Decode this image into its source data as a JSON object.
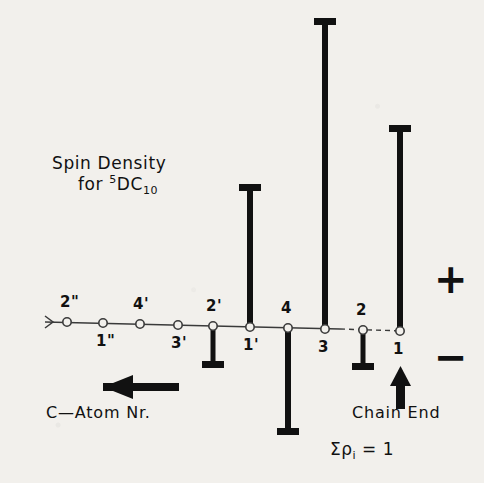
{
  "title": {
    "line1": "Spin Density",
    "line2_pre": "for ",
    "line2_sup": "5",
    "line2_mid": "DC",
    "line2_sub": "10"
  },
  "axis_caption": "C—Atom Nr.",
  "chain_end_label": "Chain End",
  "sum_rule": {
    "sigma": "Σρ",
    "sub": "i",
    "equals": "= 1",
    "full": "Σρi = 1"
  },
  "signs": {
    "positive": "+",
    "negative": "−"
  },
  "colors": {
    "ink": "#111111",
    "paper": "#f2f0ec",
    "axis": "#3a3a3a"
  },
  "chart_data": {
    "type": "bar",
    "title": "Spin Density for 5DC10",
    "xlabel": "C—Atom Nr.",
    "ylabel": "Spin density ρi",
    "grid": false,
    "legend": null,
    "orientation": "stem-plot, vertical bars with T-caps on a near-horizontal baseline",
    "note": "Baseline is the carbon chain axis; open circles mark each carbon atom. Positive bars point up (+), negative bars point down (−). Sum of all ρi equals 1.",
    "categories": [
      "2\"",
      "1\"",
      "4'",
      "3'",
      "2'",
      "1'",
      "4",
      "3",
      "2",
      "1"
    ],
    "label_side": [
      "above",
      "below",
      "above",
      "below",
      "above",
      "below",
      "above",
      "below",
      "above",
      "below"
    ],
    "values": [
      0.0,
      0.0,
      0.0,
      0.0,
      -0.11,
      0.4,
      -0.3,
      0.86,
      -0.11,
      0.56
    ],
    "bar_px": [
      {
        "category": "2\"",
        "x": 67,
        "top": 322,
        "bottom": 322,
        "sign": "zero"
      },
      {
        "category": "1\"",
        "x": 103,
        "top": 323,
        "bottom": 323,
        "sign": "zero"
      },
      {
        "category": "4'",
        "x": 140,
        "top": 324,
        "bottom": 324,
        "sign": "zero"
      },
      {
        "category": "3'",
        "x": 178,
        "top": 325,
        "bottom": 325,
        "sign": "zero"
      },
      {
        "category": "2'",
        "x": 213,
        "top": 326,
        "bottom": 368,
        "sign": "negative"
      },
      {
        "category": "1'",
        "x": 250,
        "top": 184,
        "bottom": 327,
        "sign": "positive"
      },
      {
        "category": "4",
        "x": 288,
        "top": 328,
        "bottom": 435,
        "sign": "negative"
      },
      {
        "category": "3",
        "x": 325,
        "top": 18,
        "bottom": 329,
        "sign": "positive"
      },
      {
        "category": "2",
        "x": 363,
        "top": 330,
        "bottom": 370,
        "sign": "negative"
      },
      {
        "category": "1",
        "x": 400,
        "top": 125,
        "bottom": 331,
        "sign": "positive"
      }
    ],
    "axis_px": {
      "x_start": 45,
      "y_start": 322,
      "x_end": 404,
      "y_end": 331
    },
    "ylim": [
      -0.35,
      0.95
    ]
  }
}
